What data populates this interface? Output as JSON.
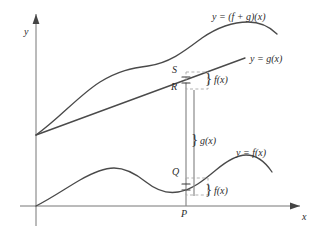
{
  "figure": {
    "background_color": "#ffffff",
    "stroke_color": "#4a4a4a",
    "axis_color": "#777777",
    "dashed_color": "#999999"
  },
  "axes": {
    "x_label": "x",
    "y_label": "y",
    "x_axis": {
      "x1": 20,
      "y1": 206,
      "x2": 300,
      "y2": 206
    },
    "y_axis": {
      "x1": 36,
      "y1": 226,
      "x2": 36,
      "y2": 14
    }
  },
  "curves": [
    {
      "name": "sum-curve",
      "label": "y = (f + g)(x)",
      "label_x": 212,
      "label_y": 12,
      "path": "M 36,135 C 60,118 78,96 100,82 C 118,71 132,68 148,66 C 170,63 186,50 202,38 C 218,27 232,22 248,22 C 262,22 270,27 277,34"
    },
    {
      "name": "g-line",
      "label": "y = g(x)",
      "label_x": 250,
      "label_y": 54,
      "path": "M 36,135 L 245,58"
    },
    {
      "name": "f-curve",
      "label": "y = f(x)",
      "label_x": 236,
      "label_y": 148,
      "path": "M 36,206 C 52,198 66,188 80,180 C 94,172 104,168 114,168 C 126,168 136,174 146,182 C 156,190 166,194 178,192 C 192,190 204,180 216,170 C 228,160 238,155 246,155 C 256,155 264,160 272,172"
    }
  ],
  "points": [
    {
      "name": "point-s",
      "label": "S",
      "x": 172,
      "y": 72
    },
    {
      "name": "point-r",
      "label": "R",
      "x": 171,
      "y": 88
    },
    {
      "name": "point-q",
      "label": "Q",
      "x": 172,
      "y": 173
    },
    {
      "name": "point-p",
      "label": "P",
      "x": 181,
      "y": 209
    }
  ],
  "annotations": [
    {
      "name": "upper-f-brace",
      "label": "f(x)",
      "brace": "}",
      "brace_x": 205,
      "brace_y": 77,
      "label_x": 215,
      "label_y": 78
    },
    {
      "name": "g-brace",
      "label": "g(x)",
      "brace": "}",
      "brace_x": 191,
      "brace_y": 138,
      "label_x": 201,
      "label_y": 139
    },
    {
      "name": "lower-f-brace",
      "label": "f(x)",
      "brace": "}",
      "brace_x": 205,
      "brace_y": 188,
      "label_x": 215,
      "label_y": 189
    }
  ],
  "measure_lines": {
    "vertical_p_line": {
      "x": 186,
      "y1": 206,
      "y2": 83
    },
    "vertical_g_bar": {
      "x": 194,
      "y1": 196,
      "y2": 90
    },
    "dashed_upper_box": {
      "x": 186,
      "y": 72,
      "w": 22,
      "h": 17
    },
    "dashed_lower_box": {
      "x": 186,
      "y": 178,
      "w": 22,
      "h": 17
    }
  },
  "tick_marks": {
    "description": "double hash marks indicating equal segment lengths",
    "upper": {
      "x": 186,
      "y": 80
    },
    "lower": {
      "x": 186,
      "y": 187
    }
  }
}
